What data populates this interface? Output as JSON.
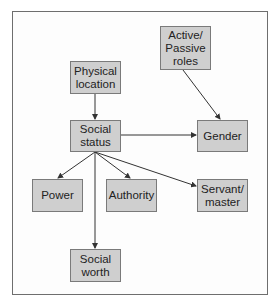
{
  "diagram": {
    "nodes": [
      {
        "id": "physical_location",
        "label": "Physical\nlocation",
        "x": 70,
        "y": 61,
        "w": 51,
        "h": 33
      },
      {
        "id": "active_passive_roles",
        "label": "Active/\nPassive\nroles",
        "x": 160,
        "y": 26,
        "w": 51,
        "h": 44
      },
      {
        "id": "social_status",
        "label": "Social\nstatus",
        "x": 70,
        "y": 120,
        "w": 51,
        "h": 32
      },
      {
        "id": "gender",
        "label": "Gender",
        "x": 197,
        "y": 120,
        "w": 51,
        "h": 32
      },
      {
        "id": "power",
        "label": "Power",
        "x": 32,
        "y": 179,
        "w": 51,
        "h": 33
      },
      {
        "id": "authority",
        "label": "Authority",
        "x": 106,
        "y": 179,
        "w": 51,
        "h": 33
      },
      {
        "id": "servant_master",
        "label": "Servant/\nmaster",
        "x": 197,
        "y": 179,
        "w": 51,
        "h": 33
      },
      {
        "id": "social_worth",
        "label": "Social\nworth",
        "x": 70,
        "y": 249,
        "w": 51,
        "h": 33
      }
    ],
    "edges": [
      {
        "from": "physical_location",
        "to": "social_status"
      },
      {
        "from": "active_passive_roles",
        "to": "gender"
      },
      {
        "from": "social_status",
        "to": "gender"
      },
      {
        "from": "social_status",
        "to": "power"
      },
      {
        "from": "social_status",
        "to": "authority"
      },
      {
        "from": "social_status",
        "to": "servant_master"
      },
      {
        "from": "social_status",
        "to": "social_worth"
      }
    ],
    "colors": {
      "node_fill": "#cfcfcf",
      "node_border": "#7a7a7a",
      "edge": "#333333",
      "frame": "#6e6e6e"
    }
  }
}
